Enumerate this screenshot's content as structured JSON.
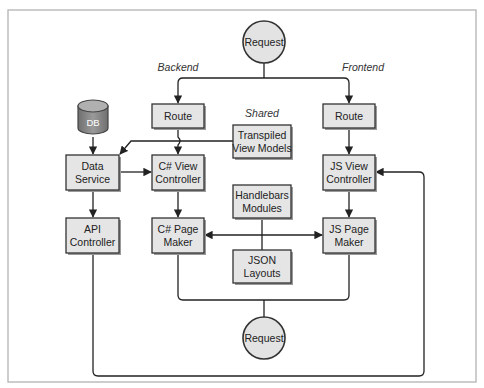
{
  "diagram": {
    "frame": {
      "border_color": "#bdbdbd",
      "background": "#ffffff"
    },
    "colors": {
      "box_fill": "#e5e5e5",
      "box_stroke": "#333333",
      "line": "#222222",
      "db_fill": "#8a8a8a",
      "db_text": "#ffffff",
      "circle_fill": "#e3e3e3"
    },
    "section_labels": {
      "backend": "Backend",
      "frontend": "Frontend",
      "shared": "Shared"
    },
    "nodes": {
      "request_top": {
        "label": "Request",
        "shape": "circle"
      },
      "db": {
        "label": "DB",
        "shape": "cylinder"
      },
      "backend_route": {
        "label": "Route"
      },
      "frontend_route": {
        "label": "Route"
      },
      "transpiled_view_models": {
        "line1": "Transpiled",
        "line2": "View Models"
      },
      "data_service": {
        "line1": "Data",
        "line2": "Service"
      },
      "cs_view_controller": {
        "line1": "C# View",
        "line2": "Controller"
      },
      "js_view_controller": {
        "line1": "JS View",
        "line2": "Controller"
      },
      "handlebars_modules": {
        "line1": "Handlebars",
        "line2": "Modules"
      },
      "api_controller": {
        "line1": "API",
        "line2": "Controller"
      },
      "cs_page_maker": {
        "line1": "C# Page",
        "line2": "Maker"
      },
      "js_page_maker": {
        "line1": "JS Page",
        "line2": "Maker"
      },
      "json_layouts": {
        "line1": "JSON",
        "line2": "Layouts"
      },
      "request_bottom": {
        "label": "Request",
        "shape": "circle"
      }
    },
    "edges": [
      {
        "from": "Request (top)",
        "to": "Route (Backend)"
      },
      {
        "from": "Request (top)",
        "to": "Route (Frontend)"
      },
      {
        "from": "Route (Backend)",
        "to": "C# View Controller"
      },
      {
        "from": "Route (Frontend)",
        "to": "JS View Controller"
      },
      {
        "from": "Transpiled View Models",
        "to": "Data Service"
      },
      {
        "from": "DB",
        "to": "Data Service"
      },
      {
        "from": "Data Service",
        "to": "C# View Controller"
      },
      {
        "from": "Data Service",
        "to": "API Controller"
      },
      {
        "from": "C# View Controller",
        "to": "C# Page Maker"
      },
      {
        "from": "JS View Controller",
        "to": "JS Page Maker"
      },
      {
        "from": "Handlebars Modules",
        "to": "C# Page Maker"
      },
      {
        "from": "Handlebars Modules",
        "to": "JS Page Maker"
      },
      {
        "from": "C# Page Maker",
        "to": "Request (bottom)"
      },
      {
        "from": "JS Page Maker",
        "to": "Request (bottom)"
      },
      {
        "from": "API Controller",
        "to": "JS View Controller"
      }
    ]
  }
}
